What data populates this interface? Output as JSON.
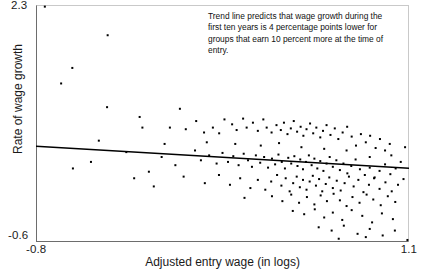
{
  "chart_data": {
    "type": "scatter",
    "title": "",
    "xlabel": "Adjusted entry wage (in logs)",
    "ylabel": "Rate of wage growth",
    "xlim": [
      -0.8,
      1.1
    ],
    "ylim": [
      -0.6,
      2.3
    ],
    "xticks": [
      "-0.8",
      "1.1"
    ],
    "yticks": [
      "-0.6",
      "2.3"
    ],
    "grid": false,
    "legend": "none",
    "annotations": [
      {
        "name": "trend-note",
        "text": "Trend line predicts that wage growth during the first ten years is 4 percentage points lower for groups that earn 10 percent more at the time of entry."
      }
    ],
    "series": [
      {
        "name": "observations",
        "type": "scatter",
        "marker": "square",
        "color": "#000000",
        "points": [
          [
            -0.755,
            2.28
          ],
          [
            -0.435,
            1.93
          ],
          [
            -0.615,
            1.53
          ],
          [
            -0.672,
            1.34
          ],
          [
            -0.438,
            1.05
          ],
          [
            -0.272,
            0.93
          ],
          [
            -0.258,
            0.8
          ],
          [
            -0.067,
            1.03
          ],
          [
            -0.118,
            0.8
          ],
          [
            -0.037,
            0.78
          ],
          [
            0.016,
            0.88
          ],
          [
            0.056,
            0.74
          ],
          [
            0.101,
            0.8
          ],
          [
            0.16,
            0.9
          ],
          [
            0.133,
            0.73
          ],
          [
            0.199,
            0.84
          ],
          [
            0.222,
            0.77
          ],
          [
            0.255,
            0.91
          ],
          [
            0.273,
            0.8
          ],
          [
            0.305,
            0.86
          ],
          [
            0.33,
            0.76
          ],
          [
            0.358,
            0.9
          ],
          [
            0.375,
            0.8
          ],
          [
            0.4,
            0.74
          ],
          [
            0.425,
            0.83
          ],
          [
            0.447,
            0.77
          ],
          [
            0.463,
            0.86
          ],
          [
            0.481,
            0.72
          ],
          [
            0.498,
            0.79
          ],
          [
            0.513,
            0.88
          ],
          [
            0.53,
            0.75
          ],
          [
            0.548,
            0.81
          ],
          [
            0.562,
            0.7
          ],
          [
            0.578,
            0.78
          ],
          [
            0.596,
            0.85
          ],
          [
            0.612,
            0.73
          ],
          [
            0.628,
            0.8
          ],
          [
            0.648,
            0.68
          ],
          [
            0.662,
            0.76
          ],
          [
            0.68,
            0.83
          ],
          [
            0.7,
            0.71
          ],
          [
            0.722,
            0.79
          ],
          [
            0.74,
            0.66
          ],
          [
            0.762,
            0.74
          ],
          [
            0.785,
            0.81
          ],
          [
            0.808,
            0.69
          ],
          [
            0.83,
            0.58
          ],
          [
            0.855,
            0.72
          ],
          [
            0.88,
            0.62
          ],
          [
            0.902,
            0.7
          ],
          [
            0.93,
            0.55
          ],
          [
            0.952,
            0.66
          ],
          [
            0.978,
            0.52
          ],
          [
            1.002,
            0.6
          ],
          [
            -0.52,
            0.38
          ],
          [
            -0.34,
            0.5
          ],
          [
            -0.16,
            0.44
          ],
          [
            -0.09,
            0.34
          ],
          [
            0.01,
            0.52
          ],
          [
            0.04,
            0.4
          ],
          [
            0.082,
            0.46
          ],
          [
            0.12,
            0.36
          ],
          [
            0.15,
            0.49
          ],
          [
            0.178,
            0.38
          ],
          [
            0.205,
            0.45
          ],
          [
            0.232,
            0.34
          ],
          [
            0.258,
            0.48
          ],
          [
            0.28,
            0.4
          ],
          [
            0.3,
            0.32
          ],
          [
            0.32,
            0.46
          ],
          [
            0.342,
            0.37
          ],
          [
            0.362,
            0.44
          ],
          [
            0.382,
            0.31
          ],
          [
            0.402,
            0.42
          ],
          [
            0.418,
            0.35
          ],
          [
            0.435,
            0.47
          ],
          [
            0.452,
            0.38
          ],
          [
            0.468,
            0.3
          ],
          [
            0.485,
            0.43
          ],
          [
            0.5,
            0.36
          ],
          [
            0.516,
            0.45
          ],
          [
            0.532,
            0.33
          ],
          [
            0.546,
            0.41
          ],
          [
            0.56,
            0.29
          ],
          [
            0.575,
            0.38
          ],
          [
            0.59,
            0.46
          ],
          [
            0.604,
            0.34
          ],
          [
            0.618,
            0.42
          ],
          [
            0.633,
            0.3
          ],
          [
            0.648,
            0.39
          ],
          [
            0.664,
            0.27
          ],
          [
            0.68,
            0.36
          ],
          [
            0.696,
            0.44
          ],
          [
            0.712,
            0.32
          ],
          [
            0.73,
            0.4
          ],
          [
            0.748,
            0.28
          ],
          [
            0.766,
            0.36
          ],
          [
            0.786,
            0.24
          ],
          [
            0.806,
            0.33
          ],
          [
            0.828,
            0.41
          ],
          [
            0.85,
            0.29
          ],
          [
            0.875,
            0.22
          ],
          [
            0.9,
            0.31
          ],
          [
            0.925,
            0.19
          ],
          [
            0.95,
            0.27
          ],
          [
            0.978,
            0.35
          ],
          [
            1.005,
            0.23
          ],
          [
            1.032,
            0.3
          ],
          [
            -0.3,
            0.18
          ],
          [
            -0.2,
            0.08
          ],
          [
            -0.048,
            0.2
          ],
          [
            0.06,
            0.12
          ],
          [
            0.132,
            0.22
          ],
          [
            0.188,
            0.1
          ],
          [
            0.24,
            0.18
          ],
          [
            0.292,
            0.06
          ],
          [
            0.33,
            0.16
          ],
          [
            0.368,
            0.04
          ],
          [
            0.398,
            0.14
          ],
          [
            0.428,
            0.22
          ],
          [
            0.45,
            0.09
          ],
          [
            0.472,
            0.18
          ],
          [
            0.492,
            0.02
          ],
          [
            0.51,
            0.12
          ],
          [
            0.528,
            0.2
          ],
          [
            0.544,
            0.07
          ],
          [
            0.56,
            0.16
          ],
          [
            0.578,
            0.04
          ],
          [
            0.594,
            0.14
          ],
          [
            0.61,
            0.21
          ],
          [
            0.626,
            0.09
          ],
          [
            0.642,
            0.17
          ],
          [
            0.658,
            0.02
          ],
          [
            0.676,
            0.11
          ],
          [
            0.694,
            0.19
          ],
          [
            0.712,
            0.06
          ],
          [
            0.732,
            0.15
          ],
          [
            0.752,
            0.03
          ],
          [
            0.772,
            0.12
          ],
          [
            0.794,
            0.2
          ],
          [
            0.818,
            0.08
          ],
          [
            0.842,
            0.16
          ],
          [
            0.868,
            0.01
          ],
          [
            0.896,
            0.1
          ],
          [
            0.922,
            0.18
          ],
          [
            0.95,
            0.05
          ],
          [
            0.98,
            0.13
          ],
          [
            1.012,
            0.02
          ],
          [
            1.044,
            0.1
          ],
          [
            0.262,
            -0.06
          ],
          [
            0.402,
            -0.04
          ],
          [
            0.455,
            -0.1
          ],
          [
            0.5,
            -0.02
          ],
          [
            0.54,
            -0.12
          ],
          [
            0.58,
            -0.05
          ],
          [
            0.618,
            -0.14
          ],
          [
            0.65,
            -0.03
          ],
          [
            0.682,
            -0.1
          ],
          [
            0.716,
            -0.01
          ],
          [
            0.748,
            -0.09
          ],
          [
            0.782,
            -0.16
          ],
          [
            0.812,
            -0.05
          ],
          [
            0.848,
            -0.12
          ],
          [
            0.884,
            -0.02
          ],
          [
            0.918,
            -0.08
          ],
          [
            0.956,
            -0.15
          ],
          [
            0.992,
            -0.04
          ],
          [
            1.03,
            -0.11
          ],
          [
            0.508,
            -0.22
          ],
          [
            0.566,
            -0.26
          ],
          [
            0.62,
            -0.2
          ],
          [
            0.668,
            -0.3
          ],
          [
            0.712,
            -0.24
          ],
          [
            0.76,
            -0.33
          ],
          [
            0.808,
            -0.21
          ],
          [
            0.862,
            -0.28
          ],
          [
            0.912,
            -0.36
          ],
          [
            0.962,
            -0.25
          ],
          [
            1.018,
            -0.32
          ],
          [
            0.64,
            -0.42
          ],
          [
            0.706,
            -0.46
          ],
          [
            0.768,
            -0.4
          ],
          [
            0.838,
            -0.5
          ],
          [
            0.9,
            -0.44
          ],
          [
            0.966,
            -0.52
          ],
          [
            1.028,
            -0.46
          ],
          [
            0.742,
            -0.56
          ],
          [
            0.88,
            -0.54
          ],
          [
            1.092,
            -0.575
          ],
          [
            -0.48,
            0.64
          ],
          [
            -0.612,
            0.3
          ],
          [
            -0.225,
            0.26
          ],
          [
            -0.145,
            0.6
          ],
          [
            0.07,
            0.62
          ],
          [
            0.215,
            0.6
          ],
          [
            0.345,
            0.58
          ],
          [
            0.438,
            0.61
          ],
          [
            0.552,
            0.56
          ],
          [
            0.668,
            0.54
          ],
          [
            0.782,
            0.52
          ],
          [
            0.9,
            0.44
          ],
          [
            1.01,
            0.46
          ],
          [
            1.058,
            0.38
          ],
          [
            1.072,
            0.17
          ],
          [
            1.08,
            0.56
          ]
        ]
      }
    ],
    "trendline": {
      "name": "trend-line",
      "type": "line",
      "color": "#000000",
      "x0": -0.8,
      "y0": 0.571,
      "x1": 1.1,
      "y1": 0.303,
      "slope": -0.4,
      "description": "Downward sloping least squares fit"
    }
  }
}
